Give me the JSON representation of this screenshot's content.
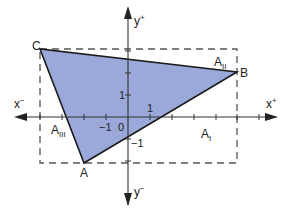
{
  "diagram": {
    "type": "coordinate-geometry",
    "axes": {
      "x_pos_label": "x",
      "x_pos_sup": "+",
      "x_neg_label": "x",
      "x_neg_sup": "−",
      "y_pos_label": "y",
      "y_pos_sup": "+",
      "y_neg_label": "y",
      "y_neg_sup": "−",
      "origin_label": "0",
      "tick_labels": {
        "x_pos_1": "1",
        "x_neg_1": "−1",
        "y_pos_1": "1",
        "y_neg_1": "−1"
      }
    },
    "points": {
      "A": {
        "label": "A",
        "x": -2,
        "y": -2
      },
      "B": {
        "label": "B",
        "x": 5,
        "y": 2
      },
      "C": {
        "label": "C",
        "x": -4,
        "y": 3
      }
    },
    "areas": {
      "A1": {
        "base": "A",
        "sub": "I"
      },
      "A2": {
        "base": "A",
        "sub": "II"
      },
      "A3": {
        "base": "A",
        "sub": "III"
      }
    },
    "colors": {
      "triangle_fill": "#9aa9d9",
      "triangle_stroke": "#1a1a1a",
      "axis": "#333333",
      "dashed_rect": "#555555",
      "text": "#222222"
    }
  }
}
